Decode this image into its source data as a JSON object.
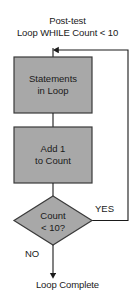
{
  "diagram": {
    "title": {
      "line1": "Post-test",
      "line2": "Loop WHILE Count < 10"
    },
    "terminal": "Loop Complete",
    "colors": {
      "shape_fill": "#a8a8a8",
      "shape_border": "#3a3a3a",
      "connector": "#1a1a1a",
      "text": "#1a1a1a",
      "background": "#ffffff"
    },
    "nodes": [
      {
        "id": "statements",
        "shape": "process",
        "line1": "Statements",
        "line2": "in Loop"
      },
      {
        "id": "increment",
        "shape": "process",
        "line1": "Add 1",
        "line2": "to Count"
      },
      {
        "id": "condition",
        "shape": "decision",
        "line1": "Count",
        "line2": "< 10?"
      }
    ],
    "branches": {
      "yes": "YES",
      "no": "NO"
    }
  }
}
